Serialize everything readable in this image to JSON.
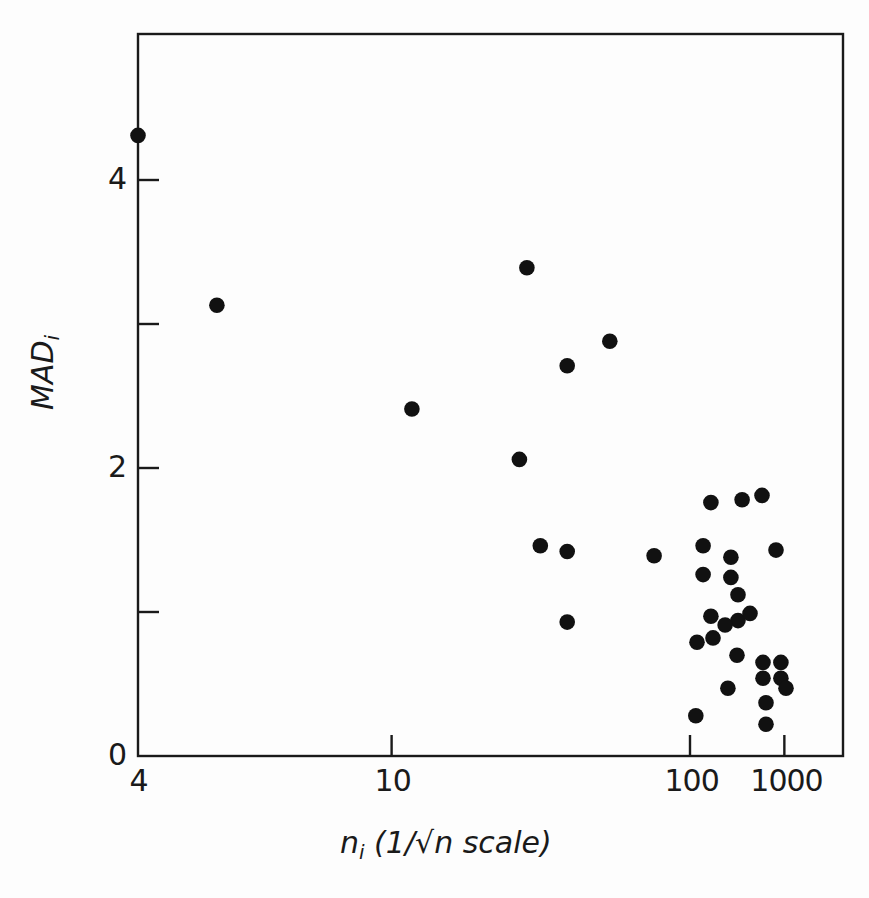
{
  "chart_data": {
    "type": "scatter",
    "title": "",
    "xlabel": "n_i (1/√n scale)",
    "ylabel": "MAD_i",
    "x_scale": "1/sqrt(n)",
    "xlim": [
      4,
      "inf"
    ],
    "ylim": [
      0,
      5
    ],
    "x_ticks": [
      {
        "value": 4,
        "label": "4"
      },
      {
        "value": 10,
        "label": "10"
      },
      {
        "value": 100,
        "label": "100"
      },
      {
        "value": 1000,
        "label": "1000"
      }
    ],
    "y_ticks": [
      {
        "value": 0,
        "label": "0"
      },
      {
        "value": 1,
        "label": ""
      },
      {
        "value": 2,
        "label": "2"
      },
      {
        "value": 3,
        "label": ""
      },
      {
        "value": 4,
        "label": "4"
      }
    ],
    "grid": false,
    "legend": null,
    "marker": {
      "shape": "filled-circle",
      "color": "#111111"
    },
    "points": [
      {
        "x": 4,
        "y": 4.31
      },
      {
        "x": 5.1,
        "y": 3.13
      },
      {
        "x": 11,
        "y": 2.41
      },
      {
        "x": 21,
        "y": 3.39
      },
      {
        "x": 20,
        "y": 2.06
      },
      {
        "x": 23,
        "y": 1.46
      },
      {
        "x": 28,
        "y": 2.71
      },
      {
        "x": 28,
        "y": 1.42
      },
      {
        "x": 28,
        "y": 0.93
      },
      {
        "x": 40,
        "y": 2.88
      },
      {
        "x": 63,
        "y": 1.39
      },
      {
        "x": 139,
        "y": 1.76
      },
      {
        "x": 258,
        "y": 1.78
      },
      {
        "x": 437,
        "y": 1.81
      },
      {
        "x": 122,
        "y": 1.46
      },
      {
        "x": 704,
        "y": 1.43
      },
      {
        "x": 202,
        "y": 1.38
      },
      {
        "x": 122,
        "y": 1.26
      },
      {
        "x": 202,
        "y": 1.24
      },
      {
        "x": 235,
        "y": 1.12
      },
      {
        "x": 139,
        "y": 0.97
      },
      {
        "x": 235,
        "y": 0.94
      },
      {
        "x": 313,
        "y": 0.99
      },
      {
        "x": 180,
        "y": 0.91
      },
      {
        "x": 111,
        "y": 0.79
      },
      {
        "x": 144,
        "y": 0.82
      },
      {
        "x": 230,
        "y": 0.7
      },
      {
        "x": 451,
        "y": 0.65
      },
      {
        "x": 860,
        "y": 0.65
      },
      {
        "x": 190,
        "y": 0.47
      },
      {
        "x": 451,
        "y": 0.54
      },
      {
        "x": 860,
        "y": 0.54
      },
      {
        "x": 1080,
        "y": 0.47
      },
      {
        "x": 496,
        "y": 0.37
      },
      {
        "x": 109,
        "y": 0.28
      },
      {
        "x": 496,
        "y": 0.22
      }
    ]
  },
  "axes": {
    "x_title_main": "n",
    "x_title_sub": "i",
    "x_title_rest": " (1/√n scale)",
    "y_title_main": "MAD",
    "y_title_sub": "i"
  }
}
